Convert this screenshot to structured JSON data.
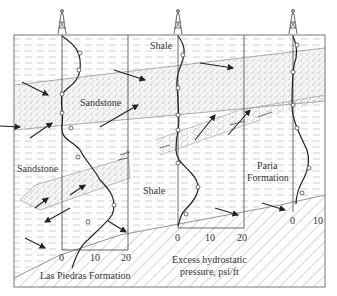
{
  "diagram": {
    "labels": {
      "shale_top": "Shale",
      "sandstone_upper": "Sandstone",
      "sandstone_lower": "Sandstone",
      "shale_middle": "Shale",
      "paria_line1": "Paria",
      "paria_line2": "Formation",
      "las_piedras": "Las Piedras Formation",
      "axis_title_line1": "Excess hydrostatic",
      "axis_title_line2": "pressure, psi/ft"
    },
    "wells": [
      {
        "name": "well-1",
        "ticks": [
          "0",
          "10",
          "20"
        ]
      },
      {
        "name": "well-2",
        "ticks": [
          "0",
          "10",
          "20"
        ]
      },
      {
        "name": "well-3",
        "ticks": [
          "0",
          "10"
        ]
      }
    ],
    "colors": {
      "line": "#333333",
      "shale_dash": "#b8b8b8",
      "sand_dot": "#8a8a8a",
      "hatch": "#9a9a9a"
    }
  }
}
